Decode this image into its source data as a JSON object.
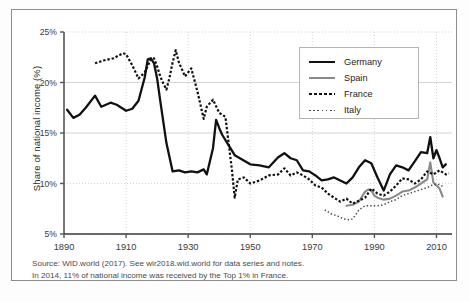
{
  "figure": {
    "ylabel": "Share of national income (%)",
    "source_lines": [
      "Source: WID.world (2017). See wir2018.wid.world for data series and notes.",
      "In 2014, 11% of national income was received by the Top 1% in France."
    ],
    "caption": ""
  },
  "legend": {
    "position": "top-right",
    "entries": [
      {
        "label": "Germany",
        "style": "solid-thick",
        "color": "#111111"
      },
      {
        "label": "Spain",
        "style": "solid-gray",
        "color": "#8a8a8a"
      },
      {
        "label": "France",
        "style": "dotted-thick",
        "color": "#111111"
      },
      {
        "label": "Italy",
        "style": "dotted-fine",
        "color": "#4a4a4a"
      }
    ]
  },
  "chart_data": {
    "type": "line",
    "title": "",
    "xlabel": "",
    "ylabel": "Share of national income (%)",
    "xlim": [
      1890,
      2015
    ],
    "ylim": [
      5,
      25
    ],
    "xticks": [
      1890,
      1910,
      1930,
      1950,
      1970,
      1990,
      2010
    ],
    "xticklabels": [
      "1890",
      "1910",
      "1930",
      "1950",
      "1970",
      "1990",
      "2010"
    ],
    "yticks": [
      5,
      10,
      15,
      20,
      25
    ],
    "yticklabels": [
      "5%",
      "10%",
      "15%",
      "20%",
      "25%"
    ],
    "grid": true,
    "grid_style": "dotted",
    "series": [
      {
        "name": "Germany",
        "style": "solid-thick",
        "color": "#111111",
        "x": [
          1891,
          1893,
          1895,
          1897,
          1900,
          1902,
          1905,
          1907,
          1910,
          1912,
          1913,
          1914,
          1916,
          1917,
          1918,
          1919,
          1920,
          1921,
          1923,
          1925,
          1927,
          1929,
          1931,
          1933,
          1935,
          1936,
          1938,
          1939,
          1940,
          1941,
          1943,
          1945,
          1950,
          1953,
          1956,
          1959,
          1961,
          1963,
          1965,
          1967,
          1969,
          1971,
          1973,
          1975,
          1977,
          1979,
          1981,
          1983,
          1985,
          1987,
          1989,
          1991,
          1993,
          1995,
          1997,
          1999,
          2001,
          2003,
          2005,
          2007,
          2008,
          2009,
          2010,
          2011,
          2012,
          2013
        ],
        "y": [
          17.3,
          16.5,
          16.8,
          17.5,
          18.7,
          17.6,
          18.0,
          17.8,
          17.2,
          17.4,
          17.8,
          18.2,
          20.5,
          22.3,
          22.4,
          21.9,
          20.4,
          18.2,
          14.0,
          11.2,
          11.3,
          11.1,
          11.2,
          11.1,
          11.4,
          10.9,
          13.5,
          16.3,
          15.5,
          14.8,
          13.8,
          12.8,
          11.9,
          11.8,
          11.6,
          12.6,
          13.0,
          12.5,
          12.3,
          11.3,
          11.2,
          10.8,
          10.3,
          10.4,
          10.6,
          10.3,
          10.0,
          10.6,
          11.6,
          12.3,
          12.0,
          10.6,
          9.3,
          10.9,
          11.8,
          11.6,
          11.3,
          12.2,
          13.1,
          13.0,
          14.6,
          12.5,
          13.3,
          12.5,
          11.6,
          11.9
        ]
      },
      {
        "name": "Spain",
        "style": "solid-gray",
        "color": "#8a8a8a",
        "x": [
          1981,
          1983,
          1985,
          1986,
          1987,
          1988,
          1989,
          1990,
          1991,
          1993,
          1995,
          1997,
          1999,
          2001,
          2003,
          2005,
          2007,
          2008,
          2009,
          2010,
          2011,
          2012
        ],
        "y": [
          7.8,
          7.9,
          8.2,
          8.7,
          9.2,
          9.4,
          9.3,
          8.8,
          8.6,
          8.4,
          8.5,
          8.8,
          9.2,
          9.3,
          9.6,
          10.0,
          10.4,
          12.1,
          10.1,
          9.8,
          9.5,
          8.7
        ]
      },
      {
        "name": "France",
        "style": "dotted-thick",
        "color": "#111111",
        "x": [
          1900,
          1903,
          1906,
          1909,
          1910,
          1912,
          1914,
          1916,
          1918,
          1919,
          1920,
          1921,
          1922,
          1923,
          1924,
          1925,
          1926,
          1927,
          1929,
          1931,
          1933,
          1935,
          1936,
          1938,
          1940,
          1942,
          1944,
          1945,
          1946,
          1948,
          1950,
          1953,
          1956,
          1959,
          1961,
          1963,
          1965,
          1967,
          1969,
          1971,
          1973,
          1975,
          1977,
          1979,
          1981,
          1983,
          1985,
          1987,
          1989,
          1991,
          1993,
          1995,
          1997,
          1999,
          2001,
          2003,
          2005,
          2007,
          2009,
          2011,
          2013,
          2014
        ],
        "y": [
          21.9,
          22.2,
          22.4,
          22.9,
          22.8,
          21.7,
          20.4,
          21.0,
          22.3,
          22.4,
          21.6,
          20.6,
          19.9,
          19.3,
          20.5,
          22.0,
          23.2,
          22.0,
          20.6,
          21.4,
          19.1,
          16.4,
          17.6,
          18.3,
          17.0,
          16.6,
          11.6,
          8.6,
          10.4,
          10.6,
          10.0,
          10.3,
          10.8,
          10.9,
          11.5,
          10.8,
          11.1,
          10.8,
          10.4,
          9.8,
          9.6,
          9.0,
          8.6,
          8.2,
          8.5,
          8.0,
          8.3,
          8.6,
          9.5,
          9.0,
          8.8,
          9.2,
          9.8,
          10.5,
          10.4,
          10.0,
          10.4,
          11.2,
          10.9,
          11.3,
          10.9,
          11.0
        ]
      },
      {
        "name": "Italy",
        "style": "dotted-fine",
        "color": "#4a4a4a",
        "x": [
          1974,
          1976,
          1978,
          1980,
          1982,
          1983,
          1984,
          1985,
          1987,
          1989,
          1991,
          1993,
          1995,
          1997,
          1999,
          2001,
          2003,
          2005,
          2007,
          2009,
          2011,
          2012
        ],
        "y": [
          7.4,
          7.0,
          6.8,
          6.5,
          6.4,
          6.5,
          6.9,
          7.4,
          7.8,
          7.8,
          7.8,
          7.9,
          8.2,
          8.4,
          8.8,
          9.0,
          9.2,
          9.4,
          9.6,
          9.9,
          9.9,
          9.7
        ]
      }
    ],
    "annotations": [
      "In 2014, 11% of national income was received by the Top 1% in France."
    ]
  }
}
